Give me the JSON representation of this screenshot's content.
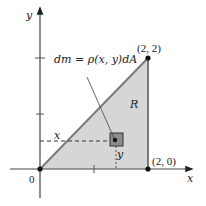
{
  "figure": {
    "axes": {
      "x_label": "x",
      "y_label": "y",
      "origin_label": "0"
    },
    "region": {
      "label": "R",
      "fill_color": "#d6d6d6",
      "edge_color": "#7a7a7a",
      "vertices": [
        [
          0,
          0
        ],
        [
          2,
          2
        ],
        [
          2,
          0
        ]
      ]
    },
    "points": {
      "top_label": "(2, 2)",
      "bottom_label": "(2, 0)"
    },
    "element": {
      "formula": "dm = ρ(x, y)dA",
      "x_label": "x",
      "y_label": "y",
      "box_color": "#8c8c8c"
    }
  }
}
